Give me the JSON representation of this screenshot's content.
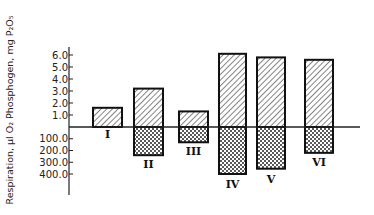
{
  "chart_data": {
    "type": "bar",
    "title": "",
    "xlabel": "",
    "ylabel": "Respiration, µl O₂ Phosphogen, mg P₂O₅",
    "categories": [
      "I",
      "II",
      "III",
      "IV",
      "V",
      "VI"
    ],
    "series": [
      {
        "name": "Respiration, µl O₂",
        "direction": "up",
        "pattern": "diagonal-hatch",
        "values": [
          1.6,
          3.2,
          1.3,
          6.1,
          5.8,
          5.6
        ]
      },
      {
        "name": "Phosphogen, mg P₂O₅",
        "direction": "down",
        "pattern": "cross-hatch",
        "values": [
          0,
          240,
          130,
          400,
          355,
          220
        ]
      }
    ],
    "upper_axis": {
      "ticks": [
        "6.0",
        "5.0",
        "4.0",
        "3.0",
        "2.0",
        "1.0"
      ],
      "range": [
        0,
        6.0
      ]
    },
    "lower_axis": {
      "ticks": [
        "100.0",
        "200.0",
        "300.0",
        "400.0"
      ],
      "range": [
        0,
        400.0
      ]
    },
    "grid": false,
    "legend": "none"
  },
  "layout": {
    "axis_x": 69,
    "baseline_y": 127,
    "axis_top": 47,
    "axis_bottom": 195,
    "baseline_end": 360,
    "px_per_upper_unit": 12,
    "px_per_lower_unit": 0.1175,
    "bars": [
      {
        "x": 93,
        "w": 29,
        "label_y": 138
      },
      {
        "x": 134,
        "w": 29,
        "label_y": 168
      },
      {
        "x": 179,
        "w": 29,
        "label_y": 155
      },
      {
        "x": 219,
        "w": 27,
        "label_y": 188
      },
      {
        "x": 257,
        "w": 28,
        "label_y": 183
      },
      {
        "x": 305,
        "w": 28,
        "label_y": 166
      }
    ]
  }
}
